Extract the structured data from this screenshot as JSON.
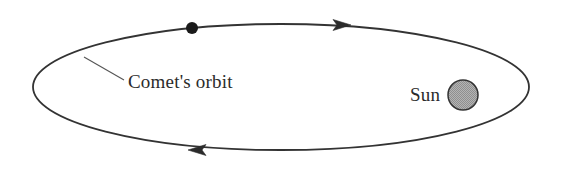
{
  "figure": {
    "type": "orbital-diagram",
    "background_color": "#ffffff"
  },
  "orbit": {
    "label": "Comet's orbit",
    "shape": "ellipse",
    "stroke_color": "#333333",
    "fill_color": "none",
    "center_x": 281,
    "center_y": 87,
    "radius_x": 248,
    "radius_y": 63,
    "stroke_width": 1.8
  },
  "direction": {
    "sense": "clockwise",
    "arrow_top_label": "arrow pointing right",
    "arrow_bottom_label": "arrow pointing left",
    "arrow_color": "#2b2b2b"
  },
  "comet": {
    "label": "comet",
    "center_x": 192,
    "center_y": 28,
    "radius": 6,
    "fill_color": "#1a1a1a"
  },
  "sun": {
    "label": "Sun",
    "center_x": 463,
    "center_y": 95,
    "radius": 15,
    "fill_color": "#a8a8a8",
    "stroke_color": "#333333",
    "label_x": 410,
    "label_y": 101
  },
  "leader_line": {
    "from_x": 84,
    "from_y": 57,
    "to_x": 124,
    "to_y": 80,
    "stroke_color": "#555555"
  },
  "orbit_label_position": {
    "x": 128,
    "y": 88
  }
}
